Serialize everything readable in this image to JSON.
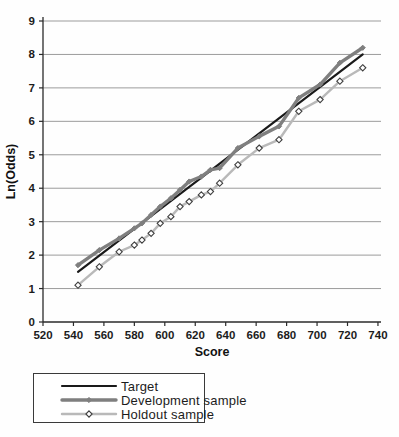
{
  "chart_data": {
    "type": "line",
    "title": "",
    "xlabel": "Score",
    "ylabel": "Ln(Odds)",
    "xlim": [
      520,
      742
    ],
    "ylim": [
      0,
      9
    ],
    "x_ticks": [
      520,
      540,
      560,
      580,
      600,
      620,
      640,
      660,
      680,
      700,
      720,
      740
    ],
    "y_ticks": [
      0,
      1,
      2,
      3,
      4,
      5,
      6,
      7,
      8,
      9
    ],
    "grid": "horizontal-only",
    "gridline_color": "#9c9c9c",
    "axis_color": "#2a2a2a",
    "legend_position": "below-left-boxed",
    "series": [
      {
        "name": "Target",
        "color": "#1a1a1a",
        "line_width": 2.2,
        "marker": "none",
        "x": [
          543,
          730
        ],
        "y": [
          1.5,
          8.0
        ]
      },
      {
        "name": "Development sample",
        "color": "#7f7f7f",
        "line_width": 3.4,
        "marker": "diamond-filled",
        "marker_size": 2.6,
        "x": [
          543,
          557,
          570,
          580,
          585,
          591,
          597,
          604,
          610,
          616,
          624,
          630,
          636,
          648,
          662,
          675,
          688,
          702,
          715,
          730
        ],
        "y": [
          1.7,
          2.15,
          2.5,
          2.8,
          2.95,
          3.2,
          3.45,
          3.7,
          3.95,
          4.2,
          4.35,
          4.55,
          4.6,
          5.2,
          5.55,
          5.85,
          6.7,
          7.1,
          7.75,
          8.2
        ]
      },
      {
        "name": "Holdout sample",
        "color": "#b9b9b9",
        "line_width": 2.4,
        "marker": "diamond-open",
        "marker_size": 3.1,
        "marker_stroke": "#3f3f3f",
        "marker_fill": "#ffffff",
        "x": [
          543,
          557,
          570,
          580,
          585,
          591,
          597,
          604,
          610,
          616,
          624,
          630,
          636,
          648,
          662,
          675,
          688,
          702,
          715,
          730
        ],
        "y": [
          1.1,
          1.65,
          2.1,
          2.3,
          2.45,
          2.65,
          2.95,
          3.15,
          3.45,
          3.6,
          3.8,
          3.9,
          4.15,
          4.7,
          5.2,
          5.45,
          6.3,
          6.65,
          7.2,
          7.6
        ]
      }
    ]
  }
}
